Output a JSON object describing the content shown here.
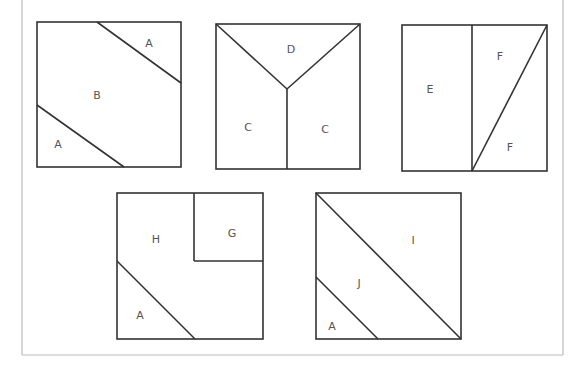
{
  "figure": {
    "colors": {
      "background": "#ffffff",
      "line": "#333333",
      "frame": "#bbbbbb",
      "label": "#555555"
    },
    "frame": {
      "left": 22,
      "right": 563,
      "top": 0,
      "bottom": 355
    },
    "blocks": [
      {
        "id": "block-1",
        "rect": [
          37,
          22,
          144,
          145
        ],
        "lines": [
          [
            97,
            22,
            181,
            83
          ],
          [
            37,
            105,
            124,
            167
          ]
        ],
        "labels": [
          {
            "text": "A",
            "x": 149,
            "y": 47
          },
          {
            "text": "B",
            "x": 97,
            "y": 99
          },
          {
            "text": "A",
            "x": 58,
            "y": 148
          }
        ]
      },
      {
        "id": "block-2",
        "rect": [
          216,
          24,
          144,
          145
        ],
        "lines": [
          [
            216,
            24,
            287,
            89
          ],
          [
            360,
            24,
            287,
            89
          ],
          [
            287,
            89,
            287,
            169
          ]
        ],
        "labels": [
          {
            "text": "D",
            "x": 291,
            "y": 53
          },
          {
            "text": "C",
            "x": 248,
            "y": 131
          },
          {
            "text": "C",
            "x": 325,
            "y": 133
          }
        ]
      },
      {
        "id": "block-3",
        "rect": [
          402,
          25,
          145,
          146
        ],
        "lines": [
          [
            472,
            25,
            472,
            171
          ],
          [
            547,
            25,
            472,
            171
          ]
        ],
        "labels": [
          {
            "text": "E",
            "x": 430,
            "y": 93
          },
          {
            "text": "F",
            "x": 500,
            "y": 60
          },
          {
            "text": "F",
            "x": 510,
            "y": 151
          }
        ]
      },
      {
        "id": "block-4",
        "rect": [
          117,
          193,
          146,
          146
        ],
        "lines": [
          [
            194,
            193,
            194,
            261
          ],
          [
            194,
            261,
            263,
            261
          ],
          [
            117,
            261,
            195,
            339
          ]
        ],
        "labels": [
          {
            "text": "H",
            "x": 156,
            "y": 243
          },
          {
            "text": "G",
            "x": 232,
            "y": 237
          },
          {
            "text": "A",
            "x": 140,
            "y": 319
          }
        ]
      },
      {
        "id": "block-5",
        "rect": [
          316,
          193,
          145,
          146
        ],
        "lines": [
          [
            316,
            193,
            461,
            339
          ],
          [
            316,
            277,
            378,
            339
          ]
        ],
        "labels": [
          {
            "text": "I",
            "x": 413,
            "y": 244
          },
          {
            "text": "J",
            "x": 359,
            "y": 287
          },
          {
            "text": "A",
            "x": 332,
            "y": 330
          }
        ]
      }
    ]
  }
}
